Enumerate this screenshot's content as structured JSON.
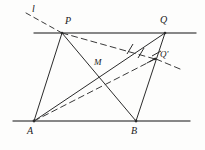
{
  "figure": {
    "type": "geometry-diagram",
    "title": "",
    "width": 205,
    "height": 150,
    "background_color": "#fdfdfc",
    "stroke_color": "#2b2b2b",
    "line_color": "#555555",
    "labels": {
      "line_l": "l",
      "point_p": "P",
      "point_q": "Q",
      "point_q_prime": "Q'",
      "point_m": "M",
      "point_a": "A",
      "point_b": "B"
    },
    "points": {
      "P": {
        "x": 62,
        "y": 33
      },
      "Q": {
        "x": 165,
        "y": 33
      },
      "Qp": {
        "x": 155,
        "y": 59
      },
      "M": {
        "x": 101,
        "y": 73
      },
      "A": {
        "x": 34,
        "y": 121
      },
      "B": {
        "x": 136,
        "y": 121
      }
    },
    "label_positions": {
      "l": {
        "x": 32,
        "y": 6
      },
      "P": {
        "x": 66,
        "y": 16
      },
      "Q": {
        "x": 161,
        "y": 15
      },
      "Qp": {
        "x": 161,
        "y": 51
      },
      "M": {
        "x": 95,
        "y": 58
      },
      "A": {
        "x": 28,
        "y": 126
      },
      "B": {
        "x": 131,
        "y": 126
      }
    },
    "horizontal_lines": [
      {
        "name": "top-parallel-line",
        "x1": 34,
        "y1": 33,
        "x2": 196,
        "y2": 33
      },
      {
        "name": "bottom-parallel-line",
        "x1": 13,
        "y1": 121,
        "x2": 190,
        "y2": 121
      }
    ],
    "solid_segments": [
      {
        "name": "segment-AP",
        "from": "A",
        "to": "P"
      },
      {
        "name": "segment-PB",
        "from": "P",
        "to": "B"
      },
      {
        "name": "segment-AQ",
        "from": "A",
        "to": "Q"
      },
      {
        "name": "segment-QB",
        "from": "Q",
        "to": "B"
      }
    ],
    "dashed_segments": [
      {
        "name": "dashed-line-l",
        "x1": 28,
        "y1": 14,
        "x2": 62,
        "y2": 33
      },
      {
        "name": "dashed-segment-PQprime",
        "x1": 62,
        "y1": 33,
        "x2": 155,
        "y2": 59
      },
      {
        "name": "dashed-segment-AQprime",
        "x1": 34,
        "y1": 121,
        "x2": 155,
        "y2": 59
      },
      {
        "name": "dashed-ray-beyond-Qprime",
        "x1": 155,
        "y1": 59,
        "x2": 180,
        "y2": 68
      }
    ],
    "tick_marks": [
      {
        "name": "tick-on-AQ",
        "x": 130,
        "y": 48.6,
        "angle": -16
      },
      {
        "name": "tick-on-PQprime",
        "x": 141,
        "y": 54.9,
        "angle": 16
      },
      {
        "name": "tick-on-QB-upper",
        "x": 151.5,
        "y": 60.5,
        "angle": 70
      },
      {
        "name": "tick-on-QQprime",
        "x": 157,
        "y": 57,
        "angle": 70
      }
    ]
  }
}
